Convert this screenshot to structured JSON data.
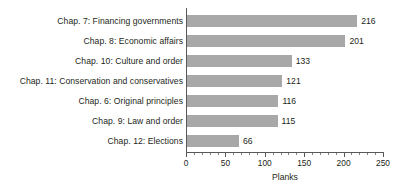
{
  "chart_data": {
    "type": "bar",
    "orientation": "horizontal",
    "title": "",
    "xlabel": "Planks",
    "ylabel": "",
    "xlim": [
      0,
      250
    ],
    "xticks": [
      0,
      50,
      100,
      150,
      200,
      250
    ],
    "xtick_labels": [
      "0",
      "50",
      "100",
      "150",
      "200",
      "250"
    ],
    "minor_tick_step": 10,
    "grid": false,
    "legend": false,
    "bar_color": "#a8a8a8",
    "axis_color": "#58595b",
    "text_color": "#231f20",
    "background": "#ffffff",
    "categories": [
      "Chap. 7: Financing governments",
      "Chap. 8: Economic affairs",
      "Chap. 10: Culture and order",
      "Chap. 11: Conservation and conservatives",
      "Chap. 6: Original principles",
      "Chap. 9: Law and order",
      "Chap. 12: Elections"
    ],
    "values": [
      216,
      201,
      133,
      121,
      116,
      115,
      66
    ],
    "value_labels": [
      "216",
      "201",
      "133",
      "121",
      "116",
      "115",
      "66"
    ]
  }
}
